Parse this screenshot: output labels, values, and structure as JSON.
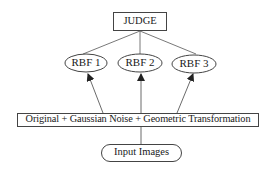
{
  "diagram": {
    "nodes": {
      "judge": {
        "label": "JUDGE",
        "shape": "rectangle"
      },
      "rbf1": {
        "label": "RBF 1",
        "shape": "ellipse"
      },
      "rbf2": {
        "label": "RBF 2",
        "shape": "ellipse"
      },
      "rbf3": {
        "label": "RBF 3",
        "shape": "ellipse"
      },
      "preprocess": {
        "label": "Original + Gaussian Noise + Geometric Transformation",
        "shape": "rectangle"
      },
      "input": {
        "label": "Input Images",
        "shape": "rounded-rectangle"
      }
    },
    "edges": [
      {
        "from": "input",
        "to": "preprocess",
        "arrow": false
      },
      {
        "from": "preprocess",
        "to": "rbf1",
        "arrow": true
      },
      {
        "from": "preprocess",
        "to": "rbf2",
        "arrow": true
      },
      {
        "from": "preprocess",
        "to": "rbf3",
        "arrow": true
      },
      {
        "from": "rbf1",
        "to": "judge",
        "arrow": false
      },
      {
        "from": "rbf2",
        "to": "judge",
        "arrow": false
      },
      {
        "from": "rbf3",
        "to": "judge",
        "arrow": false
      }
    ],
    "colors": {
      "stroke": "#333333",
      "background": "#ffffff",
      "text": "#1a1a1a"
    }
  }
}
